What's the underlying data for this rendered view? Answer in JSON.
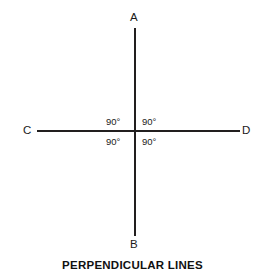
{
  "figure": {
    "title": "PERPENDICULAR LINES",
    "background_color": "#ffffff",
    "line_color": "#221f1f",
    "text_color": "#1a1a1a"
  },
  "endpoints": {
    "top": "A",
    "bottom": "B",
    "left": "C",
    "right": "D"
  },
  "angles": {
    "top_left": "90°",
    "top_right": "90°",
    "bottom_left": "90°",
    "bottom_right": "90°"
  },
  "chart_data": {
    "type": "diagram",
    "title": "PERPENDICULAR LINES",
    "lines": [
      {
        "name": "AB",
        "orientation": "vertical",
        "from_label": "A",
        "to_label": "B",
        "from": [
          135,
          28
        ],
        "to": [
          135,
          236
        ]
      },
      {
        "name": "CD",
        "orientation": "horizontal",
        "from_label": "C",
        "to_label": "D",
        "from": [
          37,
          131
        ],
        "to": [
          240,
          131
        ]
      }
    ],
    "intersection": [
      135,
      131
    ],
    "angle_labels": [
      {
        "quadrant": "top-left",
        "value": 90,
        "unit": "degrees",
        "text": "90°"
      },
      {
        "quadrant": "top-right",
        "value": 90,
        "unit": "degrees",
        "text": "90°"
      },
      {
        "quadrant": "bottom-left",
        "value": 90,
        "unit": "degrees",
        "text": "90°"
      },
      {
        "quadrant": "bottom-right",
        "value": 90,
        "unit": "degrees",
        "text": "90°"
      }
    ],
    "grid": false,
    "legend": false
  }
}
